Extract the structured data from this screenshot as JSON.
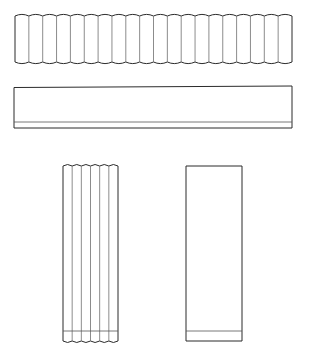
{
  "figure": {
    "title": "Corrugated and flat panel orthographic views",
    "background_color": "#ffffff",
    "canvas": {
      "width": 312,
      "height": 352
    },
    "stroke": {
      "outline_color": "#2b2b2b",
      "pleat_color": "#6e6e6e",
      "band_color": "#555555",
      "outline_width": 1.0,
      "pleat_width": 0.8,
      "band_width": 0.8
    },
    "shapes": [
      {
        "id": "shape-1",
        "name": "horizontal-corrugated-strip",
        "description": "Long horizontal corrugated strip seen edge-on, scalloped top and bottom edges",
        "x": 15,
        "y": 16,
        "width": 277,
        "height": 46,
        "pleat_count": 20,
        "orientation": "horizontal",
        "corrugated": true,
        "has_bottom_band": false
      },
      {
        "id": "shape-2",
        "name": "horizontal-flat-panel",
        "description": "Long horizontal flat rectangular panel with a thin band along the bottom edge",
        "x": 14,
        "y": 86,
        "width": 278,
        "height": 42,
        "pleat_count": 0,
        "orientation": "horizontal",
        "corrugated": false,
        "has_bottom_band": true,
        "band_offset_from_bottom": 6
      },
      {
        "id": "shape-3",
        "name": "vertical-corrugated-panel",
        "description": "Tall vertical corrugated panel, scalloped left and right, with pleat fold lines running top to bottom",
        "x": 63,
        "y": 166,
        "width": 55,
        "height": 175,
        "pleat_count": 6,
        "orientation": "vertical",
        "corrugated": true,
        "has_bottom_band": true,
        "band_offset_from_bottom": 10
      },
      {
        "id": "shape-4",
        "name": "vertical-flat-panel",
        "description": "Tall vertical flat rectangular panel with a thin band near the bottom edge",
        "x": 186,
        "y": 166,
        "width": 56,
        "height": 175,
        "pleat_count": 0,
        "orientation": "vertical",
        "corrugated": false,
        "has_bottom_band": true,
        "band_offset_from_bottom": 10
      }
    ]
  }
}
